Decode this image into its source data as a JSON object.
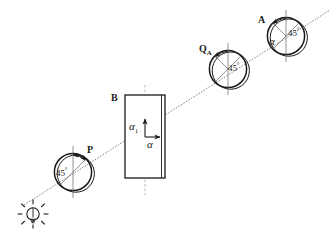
{
  "figure": {
    "background_color": "#ffffff",
    "stroke_color": "#1a1a1a",
    "width": 335,
    "height": 236
  },
  "source": {
    "name": "light-bulb",
    "label": "",
    "cx": 33,
    "cy": 214,
    "radius": 7,
    "ray_count": 8
  },
  "ray": {
    "name": "optical-axis-ray",
    "style": "thin-dashed-diagonal",
    "x1": 24,
    "y1": 205,
    "x2": 330,
    "y2": 10
  },
  "polarizers": [
    {
      "id": "P",
      "label": "P",
      "angle_label": "45",
      "degree_symbol": "°",
      "cx": 73,
      "cy": 172,
      "radius": 19,
      "axis_orientation": "vertical",
      "arc_arrow": "counterclockwise-45"
    },
    {
      "id": "Q",
      "label": "Q",
      "sublabel": "A",
      "angle_label": "45",
      "degree_symbol": "°",
      "cx": 228,
      "cy": 69,
      "radius": 19,
      "axis_orientation": "vertical",
      "arc_arrow": "counterclockwise-45"
    },
    {
      "id": "A",
      "label": "A",
      "angle_label": "45",
      "degree_symbol": "°",
      "alpha_label": "α",
      "cx": 286,
      "cy": 36,
      "radius": 19,
      "axis_orientation": "vertical",
      "arc_arrow": "counterclockwise-45"
    }
  ],
  "plate": {
    "name": "birefringent-plate",
    "label": "B",
    "x": 125,
    "y": 95,
    "width": 40,
    "height": 83,
    "edge_style": "double-line-right",
    "vectors": {
      "vertical": {
        "label": "α",
        "subscript": "1",
        "direction": "up"
      },
      "horizontal": {
        "label": "α",
        "subscript": "",
        "direction": "right"
      }
    },
    "centerline": "vertical-dashed"
  },
  "annotations": {
    "degree_symbol": "°",
    "alpha": "α"
  }
}
